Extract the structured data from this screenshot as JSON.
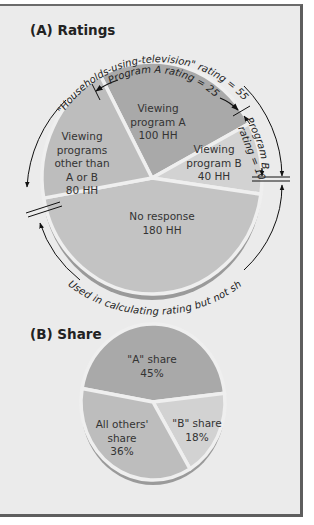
{
  "chart_data": [
    {
      "type": "pie",
      "title": "(A) Ratings",
      "unit": "HH",
      "slices": [
        {
          "key": "a",
          "label_lines": [
            "Viewing",
            "program A",
            "100 HH"
          ],
          "value": 100,
          "color": "#a9a9a9"
        },
        {
          "key": "b",
          "label_lines": [
            "Viewing",
            "program B",
            "40 HH"
          ],
          "value": 40,
          "color": "#d2d2d2"
        },
        {
          "key": "nr",
          "label_lines": [
            "No response",
            "180 HH"
          ],
          "value": 180,
          "color": "#c3c3c3"
        },
        {
          "key": "other",
          "label_lines": [
            "Viewing",
            "programs",
            "other than",
            "A or B",
            "80 HH"
          ],
          "value": 80,
          "color": "#bdbdbd"
        }
      ],
      "annotations": {
        "hut": "\"Households-using-television\" rating = 55",
        "prog_a": "Program A rating = 25",
        "prog_b_line1": "Program B",
        "prog_b_line2": "rating = 10",
        "bottom": "Used in calculating rating but not share"
      }
    },
    {
      "type": "pie",
      "title": "(B) Share",
      "unit": "%",
      "slices": [
        {
          "key": "a",
          "label_lines": [
            "\"A\" share",
            "45%"
          ],
          "value": 45,
          "color": "#a9a9a9"
        },
        {
          "key": "b",
          "label_lines": [
            "\"B\" share",
            "18%"
          ],
          "value": 18,
          "color": "#d2d2d2"
        },
        {
          "key": "others",
          "label_lines": [
            "All others'",
            "share",
            "36%"
          ],
          "value": 36,
          "color": "#bdbdbd"
        }
      ]
    }
  ]
}
